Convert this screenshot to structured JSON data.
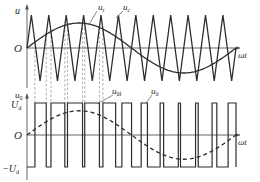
{
  "diagram": {
    "type": "pwm-waveform",
    "colors": {
      "line": "#2d2d2d",
      "axis": "#555555",
      "guide": "#8a8a8a",
      "background": "#ffffff"
    },
    "top_panel": {
      "y_axis_label": "u",
      "x_axis_label": "ωt",
      "origin_label": "O",
      "reference_label": "u",
      "reference_sub": "r",
      "carrier_label": "u",
      "carrier_sub": "c",
      "carrier_cycles": 12
    },
    "bottom_panel": {
      "y_axis_label": "u",
      "y_axis_sub": "0",
      "x_axis_label": "ωt",
      "origin_label": "O",
      "pos_level_label": "U",
      "pos_level_sub": "d",
      "neg_level_prefix": "−",
      "neg_level_label": "U",
      "neg_level_sub": "d",
      "fundamental_label": "u",
      "fundamental_sub": "0f",
      "output_label": "u",
      "output_sub": "0"
    }
  }
}
